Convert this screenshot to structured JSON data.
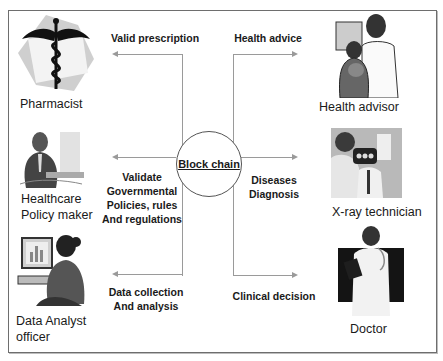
{
  "center": {
    "label": "Block chain"
  },
  "actors": {
    "pharmacist": {
      "label": "Pharmacist",
      "icon": "caduceus-icon"
    },
    "policy_maker": {
      "label_lines": [
        "Healthcare",
        "Policy maker"
      ],
      "icon": "policy-maker-clipart-icon"
    },
    "data_analyst": {
      "label_lines": [
        "Data Analyst",
        "officer"
      ],
      "icon": "data-analyst-clipart-icon"
    },
    "health_advisor": {
      "label": "Health advisor",
      "icon": "health-advisor-clipart-icon"
    },
    "xray_technician": {
      "label": "X-ray technician",
      "icon": "xray-technician-photo-icon"
    },
    "doctor": {
      "label": "Doctor",
      "icon": "doctor-clipart-icon"
    }
  },
  "flows": {
    "valid_prescription": {
      "lines": [
        "Valid prescription"
      ],
      "direction": "left"
    },
    "validate_policies": {
      "lines": [
        "Validate",
        "Governmental",
        "Policies, rules",
        "And regulations"
      ],
      "direction": "left"
    },
    "data_collection": {
      "lines": [
        "Data collection",
        "And analysis"
      ],
      "direction": "left"
    },
    "health_advice": {
      "lines": [
        "Health advice"
      ],
      "direction": "right"
    },
    "diseases_diagnosis": {
      "lines": [
        "Diseases",
        "Diagnosis"
      ],
      "direction": "right"
    },
    "clinical_decision": {
      "lines": [
        "Clinical decision"
      ],
      "direction": "right"
    }
  },
  "colors": {
    "frame": "#6e6e6e",
    "connector": "#9a9a9a",
    "hub_border": "#555555",
    "text": "#1a1a1a"
  }
}
